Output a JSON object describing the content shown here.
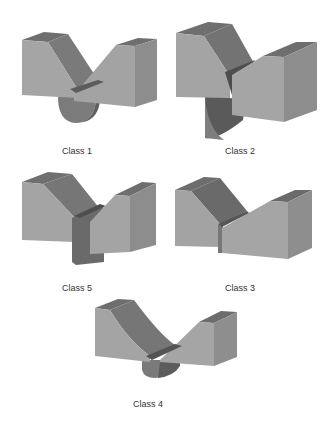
{
  "figure": {
    "colors": {
      "front": "#a3a3a3",
      "top": "#6e6e6e",
      "notch": "#7a7a7a",
      "side": "#8c8c8c",
      "cylinder": "#7d7d7d",
      "cylinder_dark": "#5e5e5e",
      "edge": "#555555"
    },
    "panels": [
      {
        "id": "class1",
        "label": "Class 1"
      },
      {
        "id": "class2",
        "label": "Class 2"
      },
      {
        "id": "class5",
        "label": "Class 5"
      },
      {
        "id": "class3",
        "label": "Class 3"
      },
      {
        "id": "class4",
        "label": "Class 4"
      }
    ]
  }
}
